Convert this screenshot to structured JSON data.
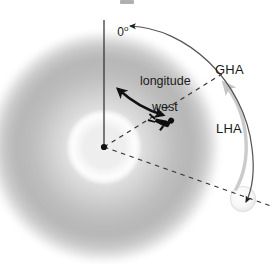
{
  "figure": {
    "title_note": "",
    "width": 276,
    "height": 264,
    "background_color": "#ffffff"
  },
  "labels": {
    "prime_meridian": "0",
    "prime_meridian_degree_symbol": "o",
    "longitude_line1": "longitude",
    "longitude_line2": "west",
    "gha": "GHA",
    "lha": "LHA"
  },
  "elements": {
    "earth_disk": "earth-disk",
    "center_dot": "earth-center-dot",
    "inner_circle": "inner-latitude-circle",
    "observer": "observer-figure",
    "celestial_body": "celestial-body-sun",
    "meridian_line": "prime-meridian-line",
    "observer_meridian_dashes": "observer-meridian-dashed-line",
    "body_meridian_dashes": "body-meridian-dashed-line",
    "longitude_arrow": "longitude-west-double-arrow",
    "gha_arc": "gha-arc-arrow",
    "lha_arc": "lha-arc-arrow"
  },
  "colors": {
    "ink": "#1a1a1a",
    "arc_stroke": "#4d4d4d",
    "lha_arc_stroke": "#cfcfcf",
    "disk_mid": "#9a9a9a",
    "disk_light": "#f2f2f2",
    "body_fill": "#f7f7f7",
    "body_stroke": "#dcdcdc"
  },
  "geometry": {
    "center_x": 104,
    "center_y": 147,
    "disk_radius": 116,
    "inner_circle_radius": 35,
    "meridian_top_y": 20,
    "body_x": 243,
    "body_y": 199,
    "body_radius": 13,
    "observer_x": 165,
    "observer_y": 124
  }
}
